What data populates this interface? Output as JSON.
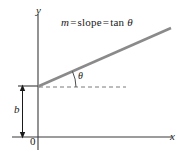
{
  "figure": {
    "axes": {
      "y_label": "y",
      "x_label": "x",
      "origin_label": "0"
    },
    "annotations": {
      "intercept_label": "b",
      "angle_label": "θ",
      "equation": {
        "full": "m = slope = tan θ",
        "symbol_m": "m",
        "equals_1": "=",
        "slope_word": "slope",
        "equals_2": "=",
        "tan_word": "tan",
        "symbol_theta": "θ"
      }
    },
    "colors": {
      "axis": "#3a3a3a",
      "slope_line": "#8a8a8a",
      "dashed_line": "#7a7a7a",
      "dimension_arrow": "#1a1a1a",
      "text": "#1a1a1a",
      "background": "#ffffff"
    },
    "geometry": {
      "slope_line_start": [
        38,
        86
      ],
      "slope_line_end": [
        171,
        28
      ],
      "dashed_line_start": [
        38,
        87
      ],
      "dashed_line_end": [
        126,
        87
      ],
      "x_axis_start": [
        12,
        137
      ],
      "x_axis_end": [
        172,
        137
      ],
      "y_axis_top": [
        38,
        14
      ],
      "y_axis_bottom": [
        38,
        150
      ],
      "intercept_tick_start": [
        18,
        86
      ],
      "intercept_tick_end": [
        38,
        86
      ],
      "angle_degrees": 24
    }
  }
}
